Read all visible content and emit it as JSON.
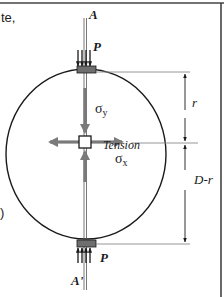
{
  "figure": {
    "text_fragments": {
      "top_left": "te,",
      "mid_left": ")"
    },
    "labels": {
      "axis_top": "A",
      "axis_bottom": "A'",
      "load_top": "P",
      "load_bottom": "P",
      "sigma_y": "σ",
      "sigma_y_sub": "y",
      "sigma_x": "σ",
      "sigma_x_sub": "x",
      "tension": "Tension",
      "dim_upper": "r",
      "dim_lower": "D-r"
    },
    "colors": {
      "line": "#1a1a1a",
      "stress_arrow": "#7a7a7a",
      "plate_fill": "#6e6e6e",
      "frame": "#444444",
      "guide_line": "#8a8a8a"
    }
  }
}
